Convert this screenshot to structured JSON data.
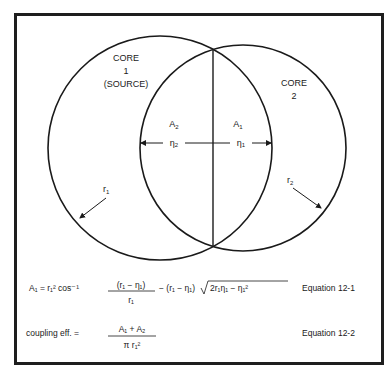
{
  "diagram": {
    "core1": {
      "title": "CORE",
      "number": "1",
      "note": "(SOURCE)",
      "radius_label": "r",
      "radius_sub": "1"
    },
    "core2": {
      "title": "CORE",
      "number": "2",
      "radius_label": "r",
      "radius_sub": "2"
    },
    "area_left": {
      "label": "A",
      "sub": "2"
    },
    "area_right": {
      "label": "A",
      "sub": "1"
    },
    "eta_left": {
      "label": "η",
      "sub": "2"
    },
    "eta_right": {
      "label": "η",
      "sub": "1"
    }
  },
  "equations": [
    {
      "lhs": "A₁ = r₁² cos⁻¹",
      "frac_num": "(r₁ − η₁)",
      "frac_den": "r₁",
      "rest": "− (r₁ − η₁)",
      "sqrt_body": "2r₁η₁ − η₁²",
      "label": "Equation 12-1"
    },
    {
      "lhs": "coupling eff. =",
      "frac_num": "A₁ + A₂",
      "frac_den": "π r₁²",
      "label": "Equation 12-2"
    }
  ],
  "colors": {
    "ink": "#1a1a1a",
    "frame": "#1e1e1e",
    "background": "#ffffff"
  }
}
